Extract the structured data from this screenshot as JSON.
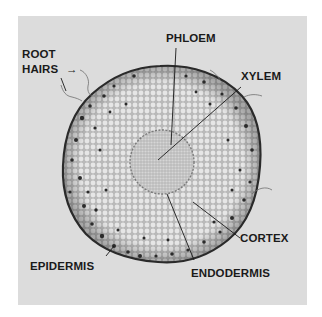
{
  "figure": {
    "labels": {
      "root_hairs_line1": "ROOT",
      "root_hairs_line2": "HAIRS",
      "root_hairs_arrow": "→",
      "phloem": "PHLOEM",
      "xylem": "XYLEM",
      "cortex": "CORTEX",
      "epidermis": "EPIDERMIS",
      "endodermis": "ENDODERMIS"
    },
    "colors": {
      "panel_background": "#dcdcdc",
      "tissue_fill": "#c8c8c8",
      "cell_outline": "#f2f2f2",
      "stele_fill": "#bdbdbd",
      "epidermis_outline": "#2a2a2a",
      "label_text": "#1a1a1a"
    }
  }
}
